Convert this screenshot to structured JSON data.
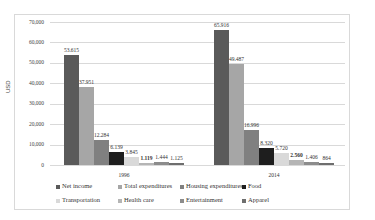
{
  "chart_data": {
    "type": "bar",
    "title": "",
    "xlabel": "",
    "ylabel": "USD",
    "ylim": [
      0,
      70000
    ],
    "yticks": [
      "0",
      "10,000",
      "20,000",
      "30,000",
      "40,000",
      "50,000",
      "60,000",
      "70,000"
    ],
    "grid": true,
    "legend_position": "bottom",
    "categories": [
      "1996",
      "2014"
    ],
    "series": [
      {
        "name": "Net income",
        "color": "#5a5a5a",
        "values": [
          53615,
          65916
        ],
        "labels": [
          "53.615",
          "65.916"
        ]
      },
      {
        "name": "Total expenditures",
        "color": "#a6a6a6",
        "values": [
          37951,
          49487
        ],
        "labels": [
          "37.951",
          "49.487"
        ]
      },
      {
        "name": "Housing expenditures",
        "color": "#808080",
        "values": [
          12284,
          16996
        ],
        "labels": [
          "12.284",
          "16.996"
        ]
      },
      {
        "name": "Food",
        "color": "#1e1e1e",
        "values": [
          6139,
          8320
        ],
        "labels": [
          "6.139",
          "8.320"
        ]
      },
      {
        "name": "Transportation",
        "color": "#d9d9d9",
        "values": [
          3845,
          5720
        ],
        "labels": [
          "3.845",
          "5.720"
        ]
      },
      {
        "name": "Health care",
        "color": "#b5b5b5",
        "values": [
          1119,
          2560
        ],
        "labels": [
          "1.119",
          "2.560"
        ]
      },
      {
        "name": "Entertainment",
        "color": "#8c8c8c",
        "values": [
          1444,
          1406
        ],
        "labels": [
          "1.444",
          "1.406"
        ]
      },
      {
        "name": "Apparel",
        "color": "#6e6e6e",
        "values": [
          1125,
          864
        ],
        "labels": [
          "1.125",
          "864"
        ]
      }
    ]
  }
}
